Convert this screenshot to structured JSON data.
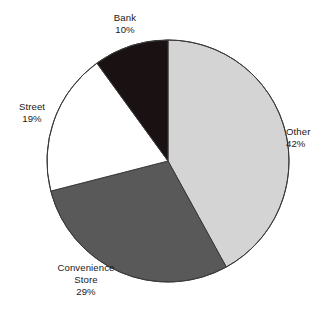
{
  "chart_data": {
    "type": "pie",
    "title": "",
    "subtitle": "",
    "xlabel": "",
    "ylabel": "",
    "legend_position": "none",
    "grid": false,
    "labels_on_slices": false,
    "start_angle_deg": 0,
    "direction": "clockwise",
    "categories": [
      "Other",
      "Convenience Store",
      "Street",
      "Bank"
    ],
    "values": [
      42,
      29,
      19,
      10
    ],
    "value_suffix": "%",
    "slices": [
      {
        "name": "Other",
        "label_line1": "Other",
        "label_line2": "",
        "value": 42,
        "value_text": "42%",
        "color": "#d4d4d4",
        "start_deg": 0,
        "end_deg": 151.2
      },
      {
        "name": "Convenience Store",
        "label_line1": "Convenience",
        "label_line2": "Store",
        "value": 29,
        "value_text": "29%",
        "color": "#595959",
        "start_deg": 151.2,
        "end_deg": 255.6
      },
      {
        "name": "Street",
        "label_line1": "Street",
        "label_line2": "",
        "value": 19,
        "value_text": "19%",
        "color": "#ffffff",
        "start_deg": 255.6,
        "end_deg": 324.0
      },
      {
        "name": "Bank",
        "label_line1": "Bank",
        "label_line2": "",
        "value": 10,
        "value_text": "10%",
        "color": "#1a1212",
        "start_deg": 324.0,
        "end_deg": 360.0
      }
    ],
    "geometry": {
      "center_x": 168,
      "center_y": 161,
      "radius": 121
    },
    "style": {
      "background": "#ffffff",
      "outline_color": "#3a3a3a",
      "outline_width": 1,
      "label_color": "#1a1a1a"
    }
  }
}
